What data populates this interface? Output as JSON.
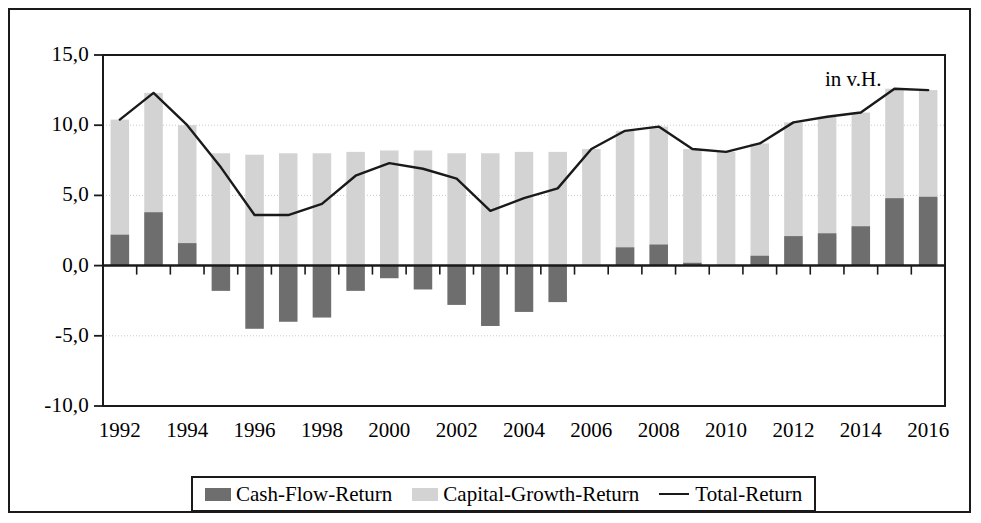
{
  "unit_note": "in v.H.",
  "legend": {
    "items": [
      {
        "label": "Cash-Flow-Return",
        "marker": "filled-square",
        "color": "#6e6e6e"
      },
      {
        "label": "Capital-Growth-Return",
        "marker": "filled-square",
        "color": "#d3d3d3"
      },
      {
        "label": "Total-Return",
        "marker": "line",
        "color": "#1a1a1a"
      }
    ]
  },
  "chart_data": {
    "type": "bar",
    "title": "",
    "subtitle": "",
    "xlabel": "",
    "ylabel": "",
    "annotations": [
      "in v.H."
    ],
    "grid": true,
    "legend_position": "bottom",
    "stacked": true,
    "ylim": [
      -10.0,
      15.0
    ],
    "yticks": [
      -10.0,
      -5.0,
      0.0,
      5.0,
      10.0,
      15.0
    ],
    "ytick_labels": [
      "-10,0",
      "-5,0",
      "0,0",
      "5,0",
      "10,0",
      "15,0"
    ],
    "x": [
      1992,
      1993,
      1994,
      1995,
      1996,
      1997,
      1998,
      1999,
      2000,
      2001,
      2002,
      2003,
      2004,
      2005,
      2006,
      2007,
      2008,
      2009,
      2010,
      2011,
      2012,
      2013,
      2014,
      2015,
      2016
    ],
    "categories": [
      "1992",
      "1993",
      "1994",
      "1995",
      "1996",
      "1997",
      "1998",
      "1999",
      "2000",
      "2001",
      "2002",
      "2003",
      "2004",
      "2005",
      "2006",
      "2007",
      "2008",
      "2009",
      "2010",
      "2011",
      "2012",
      "2013",
      "2014",
      "2015",
      "2016"
    ],
    "xtick_labels": [
      "1992",
      "1994",
      "1996",
      "1998",
      "2000",
      "2002",
      "2004",
      "2006",
      "2008",
      "2010",
      "2012",
      "2014",
      "2016"
    ],
    "series": [
      {
        "name": "Cash-Flow-Return",
        "type": "bar",
        "color": "#6e6e6e",
        "values": [
          2.2,
          3.8,
          1.6,
          -1.8,
          -4.5,
          -4.0,
          -3.7,
          -1.8,
          -0.9,
          -1.7,
          -2.8,
          -4.3,
          -3.3,
          -2.6,
          0.0,
          1.3,
          1.5,
          0.2,
          0.0,
          0.7,
          2.1,
          2.3,
          2.8,
          4.8,
          4.9
        ]
      },
      {
        "name": "Capital-Growth-Return",
        "type": "bar",
        "color": "#d3d3d3",
        "values": [
          10.4,
          12.3,
          10.0,
          8.0,
          7.9,
          8.0,
          8.0,
          8.1,
          8.2,
          8.2,
          8.0,
          8.0,
          8.1,
          8.1,
          8.3,
          9.6,
          9.9,
          8.3,
          8.1,
          8.7,
          10.2,
          10.6,
          10.9,
          12.6,
          12.5
        ]
      },
      {
        "name": "Total-Return",
        "type": "line",
        "color": "#1a1a1a",
        "values": [
          10.4,
          12.3,
          10.0,
          7.0,
          3.6,
          3.6,
          4.4,
          6.4,
          7.3,
          6.9,
          6.2,
          3.9,
          4.8,
          5.5,
          8.3,
          9.6,
          9.9,
          8.3,
          8.1,
          8.7,
          10.2,
          10.6,
          10.9,
          12.6,
          12.5
        ]
      }
    ]
  },
  "axes_geometry": {
    "plot_left": 93,
    "plot_right": 935,
    "plot_top": 45,
    "plot_bottom": 396,
    "y_zero": 262
  }
}
